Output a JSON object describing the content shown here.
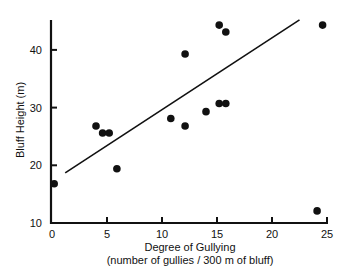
{
  "chart_data": {
    "type": "scatter",
    "title": "",
    "xlabel": "Degree of Gullying",
    "xlabel_sub": "(number of gullies / 300 m of bluff)",
    "ylabel": "Bluff Height (m)",
    "xlim": [
      0,
      25
    ],
    "ylim": [
      10,
      46
    ],
    "xticks": [
      0,
      5,
      10,
      15,
      20,
      25
    ],
    "yticks": [
      10,
      20,
      30,
      40
    ],
    "grid": false,
    "legend": null,
    "points": [
      {
        "x": 0.2,
        "y": 16.8
      },
      {
        "x": 4.0,
        "y": 26.8
      },
      {
        "x": 4.6,
        "y": 25.6
      },
      {
        "x": 5.2,
        "y": 25.6
      },
      {
        "x": 5.9,
        "y": 19.4
      },
      {
        "x": 10.8,
        "y": 28.1
      },
      {
        "x": 12.1,
        "y": 39.3
      },
      {
        "x": 12.1,
        "y": 26.8
      },
      {
        "x": 14.0,
        "y": 29.3
      },
      {
        "x": 15.2,
        "y": 44.3
      },
      {
        "x": 15.8,
        "y": 43.1
      },
      {
        "x": 15.2,
        "y": 30.7
      },
      {
        "x": 15.8,
        "y": 30.7
      },
      {
        "x": 24.1,
        "y": 12.1
      },
      {
        "x": 24.6,
        "y": 44.3
      }
    ],
    "trend_line": {
      "x1": 1.2,
      "y1": 18.7,
      "x2": 22.5,
      "y2": 45.2
    },
    "colors": {
      "points": "#111111",
      "axis": "#111111",
      "line": "#111111"
    }
  }
}
